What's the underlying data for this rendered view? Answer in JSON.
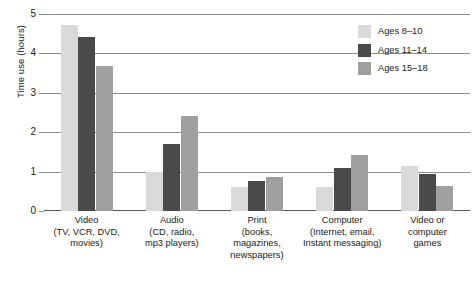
{
  "chart_data": {
    "type": "bar",
    "title": "",
    "xlabel": "",
    "ylabel": "Time use (hours)",
    "ylim": [
      0,
      5
    ],
    "yticks": [
      "0",
      "1",
      "2",
      "3",
      "4",
      "5"
    ],
    "grid": true,
    "legend_position": "top-right",
    "categories": [
      "Video\n(TV, VCR, DVD,\nmovies)",
      "Audio\n(CD, radio,\nmp3 players)",
      "Print\n(books,\nmagazines,\nnewspapers)",
      "Computer\n(Internet, email,\nInstant messaging)",
      "Video or\ncomputer\ngames"
    ],
    "category_lines": [
      [
        "Video",
        "(TV, VCR, DVD,",
        "movies)"
      ],
      [
        "Audio",
        "(CD, radio,",
        "mp3 players)"
      ],
      [
        "Print",
        "(books,",
        "magazines,",
        "newspapers)"
      ],
      [
        "Computer",
        "(Internet, email,",
        "Instant messaging)"
      ],
      [
        "Video or",
        "computer",
        "games"
      ]
    ],
    "series": [
      {
        "name": "Ages 8–10",
        "color": "#d9d9d9",
        "values": [
          4.72,
          1.0,
          0.6,
          0.62,
          1.13
        ]
      },
      {
        "name": "Ages 11–14",
        "color": "#4a4a4a",
        "values": [
          4.42,
          1.7,
          0.75,
          1.08,
          0.93
        ]
      },
      {
        "name": "Ages 15–18",
        "color": "#a0a0a0",
        "values": [
          3.68,
          2.42,
          0.87,
          1.42,
          0.63
        ]
      }
    ]
  },
  "legend": {
    "items": [
      {
        "label": "Ages 8–10",
        "color": "#d9d9d9"
      },
      {
        "label": "Ages 11–14",
        "color": "#4a4a4a"
      },
      {
        "label": "Ages 15–18",
        "color": "#a0a0a0"
      }
    ]
  },
  "axes": {
    "y_title": "Time use (hours)"
  },
  "colors": {
    "gridline": "#8c8c8c",
    "baseline": "#5a5a5a",
    "background": "#ffffff",
    "text": "#1a1a1a"
  }
}
